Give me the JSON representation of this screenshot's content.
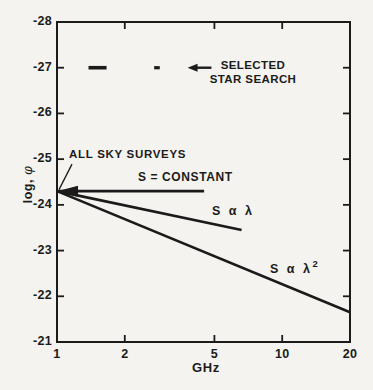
{
  "window": {
    "width": 373,
    "height": 390
  },
  "style": {
    "background": "#f4f3ef",
    "ink": "#1b1b1b"
  },
  "labels": {
    "selected_star_search_line1": "SELECTED",
    "selected_star_search_line2": "STAR SEARCH",
    "all_sky_surveys": "ALL SKY SURVEYS",
    "s_constant": "S = CONSTANT",
    "s_lambda": "S α λ",
    "s_lambda2_base": "S α λ",
    "s_lambda2_sup": "2",
    "x_axis_title": "GHz",
    "y_axis_base": "log,",
    "y_axis_phi": "φ"
  },
  "chart_data": {
    "type": "line",
    "title": "",
    "x_axis": {
      "label": "GHz",
      "scale": "log",
      "range": [
        1,
        20
      ],
      "ticks": [
        1,
        2,
        5,
        10,
        20
      ],
      "interior_tick_marks": [
        2,
        5,
        10
      ]
    },
    "y_axis": {
      "label": "log, φ",
      "range_top_to_bottom": [
        -28,
        -21
      ],
      "ticks": [
        -28,
        -27,
        -26,
        -25,
        -24,
        -23,
        -22,
        -21
      ],
      "interior_tick_marks": [
        -27,
        -26,
        -25,
        -24,
        -23,
        -22
      ]
    },
    "grid": false,
    "frame": "full-box",
    "series": [
      {
        "name": "S = CONSTANT",
        "points": [
          [
            1,
            -24.3
          ],
          [
            4.5,
            -24.3
          ]
        ]
      },
      {
        "name": "S α λ",
        "points": [
          [
            1,
            -24.3
          ],
          [
            6.6,
            -23.45
          ]
        ]
      },
      {
        "name": "S α λ2",
        "points": [
          [
            1,
            -24.3
          ],
          [
            20,
            -21.65
          ]
        ]
      }
    ],
    "star_search_segments": [
      {
        "y": -27,
        "x1": 1.38,
        "x2": 1.66,
        "weight": "thick"
      },
      {
        "y": -27,
        "x1": 2.7,
        "x2": 2.86,
        "weight": "thin"
      }
    ],
    "annotations": [
      {
        "text": "SELECTED STAR SEARCH",
        "style": "left-arrow",
        "y": -27,
        "arrow_tip_x": 3.8,
        "arrow_tail_x": 4.85
      },
      {
        "text": "ALL SKY SURVEYS",
        "style": "pointer-line",
        "target": [
          1,
          -24.3
        ]
      }
    ]
  }
}
